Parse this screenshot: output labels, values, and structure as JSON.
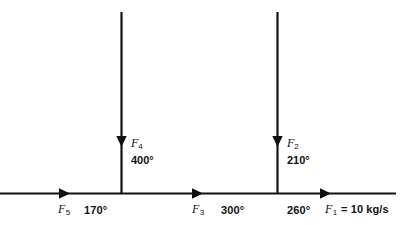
{
  "figure": {
    "background_color": "#ffffff",
    "stroke_color": "#111111",
    "width": 401,
    "height": 225
  },
  "streams": {
    "f1": {
      "symbol": "F",
      "subscript": "1",
      "value_label": "= 10 kg/s",
      "angle": "260°",
      "direction": "right"
    },
    "f2": {
      "symbol": "F",
      "subscript": "2",
      "angle": "210°",
      "direction": "down"
    },
    "f3": {
      "symbol": "F",
      "subscript": "3",
      "angle": "300°",
      "direction": "right"
    },
    "f4": {
      "symbol": "F",
      "subscript": "4",
      "angle": "400°",
      "direction": "down"
    },
    "f5": {
      "symbol": "F",
      "subscript": "5",
      "angle": "170°",
      "direction": "right"
    }
  },
  "labels": {
    "f5_symbol": "F",
    "f5_sub": "5",
    "f5_angle": "170°",
    "f3_symbol": "F",
    "f3_sub": "3",
    "f3_angle": "300°",
    "f1_angle": "260°",
    "f1_symbol": "F",
    "f1_sub": "1",
    "f1_value": "= 10 kg/s",
    "f4_symbol": "F",
    "f4_sub": "4",
    "f4_angle": "400°",
    "f2_symbol": "F",
    "f2_sub": "2",
    "f2_angle": "210°"
  }
}
